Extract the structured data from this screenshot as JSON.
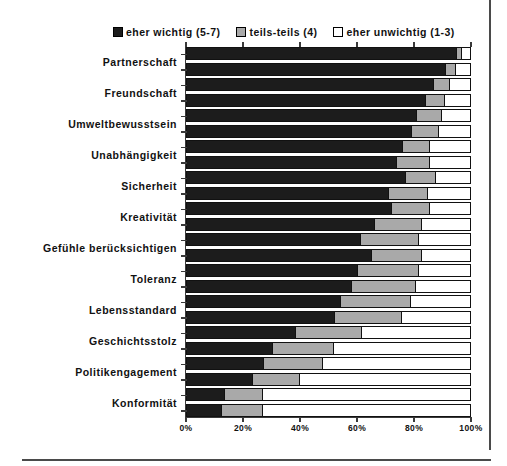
{
  "legend": {
    "entries": [
      {
        "label": "eher wichtig (5-7)",
        "color": "#1c1c1c",
        "key": "wichtig"
      },
      {
        "label": "teils-teils (4)",
        "color": "#a9a9a9",
        "key": "teils"
      },
      {
        "label": "eher unwichtig (1-3)",
        "color": "#ffffff",
        "key": "unwichtig"
      }
    ]
  },
  "chart_data": {
    "type": "bar",
    "orientation": "horizontal",
    "stacked": true,
    "normalized_percent": true,
    "title": "",
    "xlabel": "",
    "ylabel": "",
    "xlim": [
      0,
      100
    ],
    "xticks": [
      0,
      20,
      40,
      60,
      80,
      100
    ],
    "xtick_labels": [
      "0%",
      "20%",
      "40%",
      "60%",
      "80%",
      "100%"
    ],
    "grid": false,
    "legend_position": "top",
    "series": [
      {
        "name": "eher wichtig (5-7)",
        "color": "#1c1c1c"
      },
      {
        "name": "teils-teils (4)",
        "color": "#a9a9a9"
      },
      {
        "name": "eher unwichtig (1-3)",
        "color": "#ffffff"
      }
    ],
    "categories": [
      "Partnerschaft",
      "Freundschaft",
      "Umweltbewusstsein",
      "Unabhängigkeit",
      "Sicherheit",
      "Kreativität",
      "Gefühle berücksichtigen",
      "Toleranz",
      "Lebensstandard",
      "Geschichtsstolz",
      "Politikengagement",
      "Konformität"
    ],
    "groups_per_category": 2,
    "rows": [
      {
        "category": "Partnerschaft",
        "group": 1,
        "values": [
          95,
          2,
          3
        ]
      },
      {
        "category": "Partnerschaft",
        "group": 2,
        "values": [
          91,
          4,
          5
        ]
      },
      {
        "category": "Freundschaft",
        "group": 1,
        "values": [
          87,
          6,
          7
        ]
      },
      {
        "category": "Freundschaft",
        "group": 2,
        "values": [
          84,
          7,
          9
        ]
      },
      {
        "category": "Umweltbewusstsein",
        "group": 1,
        "values": [
          81,
          9,
          10
        ]
      },
      {
        "category": "Umweltbewusstsein",
        "group": 2,
        "values": [
          79,
          10,
          11
        ]
      },
      {
        "category": "Unabhängigkeit",
        "group": 1,
        "values": [
          76,
          10,
          14
        ]
      },
      {
        "category": "Unabhängigkeit",
        "group": 2,
        "values": [
          74,
          12,
          14
        ]
      },
      {
        "category": "Sicherheit",
        "group": 1,
        "values": [
          77,
          11,
          12
        ]
      },
      {
        "category": "Sicherheit",
        "group": 2,
        "values": [
          71,
          14,
          15
        ]
      },
      {
        "category": "Kreativität",
        "group": 1,
        "values": [
          72,
          14,
          14
        ]
      },
      {
        "category": "Kreativität",
        "group": 2,
        "values": [
          66,
          17,
          17
        ]
      },
      {
        "category": "Gefühle berücksichtigen",
        "group": 1,
        "values": [
          61,
          21,
          18
        ]
      },
      {
        "category": "Gefühle berücksichtigen",
        "group": 2,
        "values": [
          65,
          18,
          17
        ]
      },
      {
        "category": "Toleranz",
        "group": 1,
        "values": [
          60,
          22,
          18
        ]
      },
      {
        "category": "Toleranz",
        "group": 2,
        "values": [
          58,
          23,
          19
        ]
      },
      {
        "category": "Lebensstandard",
        "group": 1,
        "values": [
          54,
          25,
          21
        ]
      },
      {
        "category": "Lebensstandard",
        "group": 2,
        "values": [
          52,
          24,
          24
        ]
      },
      {
        "category": "Geschichtsstolz",
        "group": 1,
        "values": [
          38,
          24,
          38
        ]
      },
      {
        "category": "Geschichtsstolz",
        "group": 2,
        "values": [
          30,
          22,
          48
        ]
      },
      {
        "category": "Politikengagement",
        "group": 1,
        "values": [
          27,
          21,
          52
        ]
      },
      {
        "category": "Politikengagement",
        "group": 2,
        "values": [
          23,
          17,
          60
        ]
      },
      {
        "category": "Konformität",
        "group": 1,
        "values": [
          13,
          14,
          73
        ]
      },
      {
        "category": "Konformität",
        "group": 2,
        "values": [
          12,
          15,
          73
        ]
      }
    ]
  }
}
